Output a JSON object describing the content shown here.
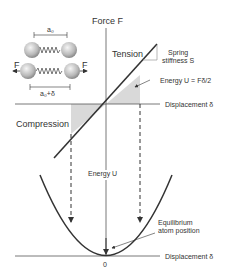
{
  "top_graph": {
    "y_axis_label": "Force F",
    "x_axis_label": "Displacement δ",
    "tension_label": "Tension",
    "compression_label": "Compression",
    "stiffness_label_line1": "Spring",
    "stiffness_label_line2": "stiffness S",
    "energy_label": "Energy U = Fδ/2"
  },
  "atoms_inset": {
    "spacing_label": "a₀",
    "stretched_label": "a₀+δ",
    "force_left": "F",
    "force_right": "F"
  },
  "bottom_graph": {
    "y_axis_label": "Energy U",
    "x_axis_label": "Displacement δ",
    "origin_label": "0",
    "equilibrium_label_line1": "Equilibrium",
    "equilibrium_label_line2": "atom position"
  },
  "colors": {
    "line": "#333333",
    "shade": "#d9d9d9",
    "axis": "#555555"
  }
}
